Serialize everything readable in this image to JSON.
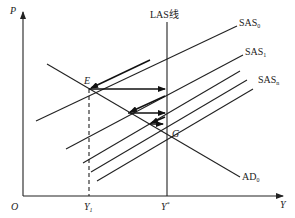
{
  "diagram": {
    "type": "AD-AS macroeconomic diagram",
    "axes": {
      "y_axis_label": "P",
      "x_axis_label": "Y",
      "origin_label": "O",
      "x_ticks": [
        {
          "label": "Y",
          "subscript": "1"
        },
        {
          "label": "Y",
          "superscript": "*"
        }
      ]
    },
    "curves": {
      "las": {
        "label": "LAS线"
      },
      "sas0": {
        "label": "SAS",
        "subscript": "0"
      },
      "sas1": {
        "label": "SAS",
        "subscript": "1"
      },
      "sasn": {
        "label": "SAS",
        "subscript": "n"
      },
      "ad0": {
        "label": "AD",
        "subscript": "0"
      }
    },
    "points": {
      "e": {
        "label": "E"
      },
      "g": {
        "label": "G"
      }
    },
    "colors": {
      "line": "#222222",
      "background": "#ffffff"
    }
  }
}
